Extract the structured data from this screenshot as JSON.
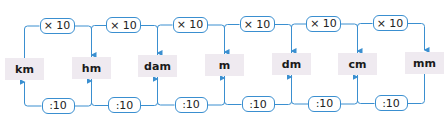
{
  "diagram": {
    "line_color": "#3a8fd0",
    "unit_bg": "#efeaf0",
    "units": [
      {
        "label": "km",
        "x": 5,
        "y": 58
      },
      {
        "label": "hm",
        "x": 72,
        "y": 57
      },
      {
        "label": "dam",
        "x": 138,
        "y": 55
      },
      {
        "label": "m",
        "x": 205,
        "y": 54
      },
      {
        "label": "dm",
        "x": 272,
        "y": 53
      },
      {
        "label": "cm",
        "x": 338,
        "y": 53
      },
      {
        "label": "mm",
        "x": 405,
        "y": 52
      }
    ],
    "multiply_label": "× 10",
    "divide_label": ":10",
    "multiply_steps": [
      {
        "label": "× 10",
        "from": "km",
        "to": "hm"
      },
      {
        "label": "× 10",
        "from": "hm",
        "to": "dam"
      },
      {
        "label": "× 10",
        "from": "dam",
        "to": "m"
      },
      {
        "label": "× 10",
        "from": "m",
        "to": "dm"
      },
      {
        "label": "× 10",
        "from": "dm",
        "to": "cm"
      },
      {
        "label": "× 10",
        "from": "cm",
        "to": "mm"
      }
    ],
    "divide_steps": [
      {
        "label": ":10",
        "from": "hm",
        "to": "km"
      },
      {
        "label": ":10",
        "from": "dam",
        "to": "hm"
      },
      {
        "label": ":10",
        "from": "m",
        "to": "dam"
      },
      {
        "label": ":10",
        "from": "dm",
        "to": "m"
      },
      {
        "label": ":10",
        "from": "cm",
        "to": "dm"
      },
      {
        "label": ":10",
        "from": "mm",
        "to": "cm"
      }
    ]
  }
}
